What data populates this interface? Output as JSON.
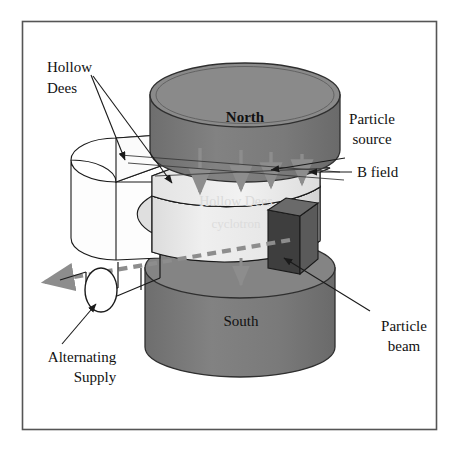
{
  "figure": {
    "kind": "cyclotron-schematic-diagram",
    "top_cutoff_text": "Cyclotron diagram",
    "frame": {
      "x": 22,
      "y": 21,
      "width": 415,
      "height": 409,
      "stroke": "#555555",
      "fill": "#ffffff"
    },
    "background_color": "#ffffff"
  },
  "colors": {
    "magnet_body": "#7b7b7b",
    "magnet_top": "#6f6f6f",
    "magnet_edge": "#2f2f2f",
    "dee_front_light": "#e9e9e9",
    "dee_top_light": "#dcdcdc",
    "dee_back_white": "#fcfcfc",
    "dee_side_shadow": "#c9c9c9",
    "target_box_dark": "#4a4a4a",
    "target_box_darker": "#3a3a3a",
    "b_field_arrow": "#8d8d8d",
    "beam_arrow": "#8d8d8d",
    "leader_line": "#1a1a1a",
    "text": "#111111"
  },
  "labels": {
    "hollow_dees": {
      "line1": "Hollow",
      "line2": "Dees",
      "x": 47,
      "y": 66,
      "anchor": "start"
    },
    "north": {
      "text": "North",
      "x": 245,
      "y": 116,
      "bold": true
    },
    "south": {
      "text": "South",
      "x": 241,
      "y": 321,
      "bold": false
    },
    "particle_source": {
      "line1": "Particle",
      "line2": "source",
      "x": 372,
      "y": 120,
      "anchor": "middle"
    },
    "b_field": {
      "text": "B field",
      "x": 355,
      "y": 170,
      "anchor": "start"
    },
    "particle_beam": {
      "line1": "Particle",
      "line2": "beam",
      "x": 403,
      "y": 330,
      "anchor": "middle"
    },
    "alternating_supply": {
      "line1": "Alternating",
      "line2": "Supply",
      "x": 82,
      "y": 358,
      "anchor": "middle"
    }
  },
  "elements": {
    "north_magnet": {
      "name": "North pole magnet",
      "cx": 245,
      "cy": 95,
      "rx": 95,
      "ry": 32,
      "height": 86
    },
    "south_magnet": {
      "name": "South pole magnet",
      "cx": 240,
      "cy": 300,
      "rx": 95,
      "ry": 30,
      "height": 78
    },
    "dee_front": {
      "name": "Front hollow dee"
    },
    "dee_back": {
      "name": "Back hollow dee"
    },
    "target_box": {
      "name": "Beam target box"
    },
    "ac_source": {
      "name": "Alternating supply ellipse",
      "cx": 101,
      "cy": 290,
      "rx": 16,
      "ry": 22
    }
  },
  "b_field_arrows": {
    "count": 4,
    "direction": "down",
    "color": "#8d8d8d",
    "positions": [
      {
        "x": 200,
        "y1": 148,
        "y2": 195
      },
      {
        "x": 241,
        "y1": 150,
        "y2": 192
      },
      {
        "x": 271,
        "y1": 152,
        "y2": 189
      },
      {
        "x": 302,
        "y1": 154,
        "y2": 186
      },
      {
        "x": 241,
        "y1": 258,
        "y2": 288
      }
    ]
  },
  "pointer_arrows": {
    "particle_source_pointer": {
      "from_x": 344,
      "from_y": 158,
      "to_x": 268,
      "to_y": 172
    },
    "b_field_pointer": {
      "from_x": 352,
      "from_y": 172,
      "to_x": 307,
      "to_y": 172
    }
  },
  "beam": {
    "name": "particle beam dashed arrow",
    "from_x": 288,
    "from_y": 241,
    "to_x": 42,
    "to_y": 283,
    "dash": "9 6",
    "color": "#8d8d8d",
    "width": 4
  }
}
